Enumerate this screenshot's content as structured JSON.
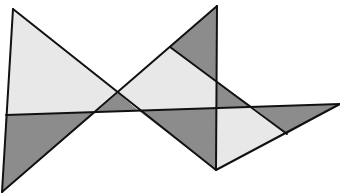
{
  "figure": {
    "type": "geometric-tessellation",
    "width": 340,
    "height": 194,
    "colors": {
      "background": "#ffffff",
      "light": "#e8e8e8",
      "dark": "#8c8c8c",
      "stroke": "#111111"
    },
    "stroke_width": 2,
    "regions": [
      {
        "name": "top-left-light-triangle",
        "shade": "light",
        "points": "13,9 6,115 96,112 118,93"
      },
      {
        "name": "bottom-left-dark-triangle",
        "shade": "dark",
        "points": "6,115 96,112 2,192"
      },
      {
        "name": "center-small-dark-triangle",
        "shade": "dark",
        "points": "118,93 96,112 139,111"
      },
      {
        "name": "center-light-quad",
        "shade": "light",
        "points": "118,93 170,47 217,82 217,108 139,111"
      },
      {
        "name": "top-right-dark-triangle",
        "shade": "dark",
        "points": "170,47 217,6 217,82"
      },
      {
        "name": "mid-right-dark-triangle",
        "shade": "dark",
        "points": "217,82 217,108 253,107"
      },
      {
        "name": "lower-center-dark-triangle",
        "shade": "dark",
        "points": "139,111 217,108 216,170"
      },
      {
        "name": "lower-right-light-quad",
        "shade": "light",
        "points": "217,108 253,107 287,134 216,170"
      },
      {
        "name": "far-right-dark-triangle",
        "shade": "dark",
        "points": "253,107 340,104 287,134"
      }
    ],
    "lines": [
      {
        "name": "left-edge",
        "x1": 13,
        "y1": 9,
        "x2": 2,
        "y2": 192
      },
      {
        "name": "diagonal-down-main",
        "x1": 13,
        "y1": 9,
        "x2": 216,
        "y2": 170
      },
      {
        "name": "diagonal-up-main",
        "x1": 2,
        "y1": 192,
        "x2": 217,
        "y2": 6
      },
      {
        "name": "vertical-line",
        "x1": 217,
        "y1": 6,
        "x2": 216,
        "y2": 170
      },
      {
        "name": "horizontal-band-line",
        "x1": 6,
        "y1": 115,
        "x2": 340,
        "y2": 104
      },
      {
        "name": "bottom-right-edge",
        "x1": 216,
        "y1": 170,
        "x2": 340,
        "y2": 104
      },
      {
        "name": "diagonal-down-secondary",
        "x1": 170,
        "y1": 47,
        "x2": 287,
        "y2": 134
      }
    ]
  }
}
